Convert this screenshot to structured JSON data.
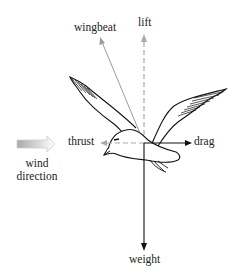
{
  "diagram": {
    "type": "forces-on-bird-in-flight",
    "labels": {
      "wingbeat": "wingbeat",
      "lift": "lift",
      "thrust": "thrust",
      "drag": "drag",
      "weight": "weight",
      "wind_line1": "wind",
      "wind_line2": "direction"
    },
    "arrows": [
      {
        "name": "lift",
        "direction": "up",
        "style": "dashed",
        "color": "#aaaaaa"
      },
      {
        "name": "wingbeat",
        "direction": "up-left",
        "style": "solid",
        "color": "#999999"
      },
      {
        "name": "thrust",
        "direction": "left",
        "style": "dashed",
        "color": "#aaaaaa"
      },
      {
        "name": "drag",
        "direction": "right",
        "style": "solid",
        "color": "#111111"
      },
      {
        "name": "weight",
        "direction": "down",
        "style": "solid",
        "color": "#111111"
      },
      {
        "name": "wind-direction",
        "direction": "right",
        "style": "gradient-hollow",
        "color": "#bbbbbb"
      }
    ]
  }
}
